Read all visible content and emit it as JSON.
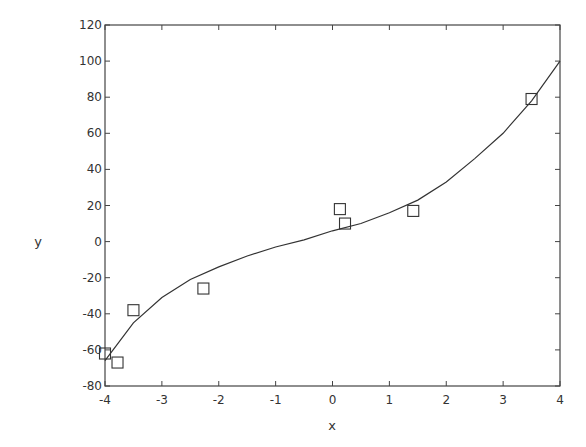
{
  "chart_data": {
    "type": "scatter",
    "title": "",
    "xlabel": "x",
    "ylabel": "y",
    "xlim": [
      -4,
      4
    ],
    "ylim": [
      -80,
      120
    ],
    "xticks": [
      -4,
      -3,
      -2,
      -1,
      0,
      1,
      2,
      3,
      4
    ],
    "yticks": [
      -80,
      -60,
      -40,
      -20,
      0,
      20,
      40,
      60,
      80,
      100,
      120
    ],
    "grid": false,
    "legend": null,
    "series": [
      {
        "name": "data",
        "type": "scatter",
        "marker": "square",
        "x": [
          -4.0,
          -3.78,
          -3.5,
          -2.27,
          0.13,
          0.22,
          1.42,
          3.5
        ],
        "y": [
          -62,
          -67,
          -38,
          -26,
          18,
          10,
          17,
          79
        ]
      },
      {
        "name": "fit",
        "type": "line",
        "x": [
          -4.0,
          -3.5,
          -3.0,
          -2.5,
          -2.0,
          -1.5,
          -1.0,
          -0.5,
          0.0,
          0.5,
          1.0,
          1.5,
          2.0,
          2.5,
          3.0,
          3.5,
          4.0
        ],
        "y": [
          -66,
          -45,
          -31,
          -21,
          -14,
          -8,
          -3,
          1,
          6,
          10,
          16,
          23,
          33,
          46,
          60,
          78,
          100
        ]
      }
    ]
  }
}
